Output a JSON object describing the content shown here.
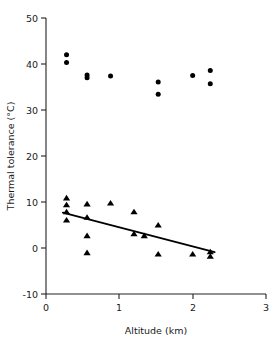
{
  "chart_data": {
    "type": "scatter",
    "title": "",
    "xlabel": "Altitude (km)",
    "ylabel": "Thermal tolerance (°C)",
    "xlim": [
      0,
      3
    ],
    "ylim": [
      -10,
      50
    ],
    "xticks": [
      0,
      1,
      2,
      3
    ],
    "xtick_labels": [
      "0",
      "1",
      "2",
      "3"
    ],
    "yticks": [
      -10,
      0,
      10,
      20,
      30,
      40,
      50
    ],
    "ytick_labels": [
      "-10",
      "0",
      "10",
      "20",
      "30",
      "40",
      "50"
    ],
    "grid": false,
    "legend": "none",
    "series": [
      {
        "name": "Upper thermal tolerance",
        "marker": "circle",
        "color": "#000000",
        "points": [
          {
            "x": 0.28,
            "y": 42.0
          },
          {
            "x": 0.28,
            "y": 40.3
          },
          {
            "x": 0.56,
            "y": 37.6
          },
          {
            "x": 0.56,
            "y": 37.0
          },
          {
            "x": 0.88,
            "y": 37.4
          },
          {
            "x": 1.53,
            "y": 36.1
          },
          {
            "x": 1.53,
            "y": 33.4
          },
          {
            "x": 2.0,
            "y": 37.5
          },
          {
            "x": 2.24,
            "y": 38.6
          },
          {
            "x": 2.24,
            "y": 35.7
          }
        ]
      },
      {
        "name": "Lower thermal tolerance",
        "marker": "triangle",
        "color": "#000000",
        "points": [
          {
            "x": 0.28,
            "y": 10.8
          },
          {
            "x": 0.28,
            "y": 9.3
          },
          {
            "x": 0.28,
            "y": 7.8
          },
          {
            "x": 0.28,
            "y": 6.0
          },
          {
            "x": 0.56,
            "y": 9.5
          },
          {
            "x": 0.56,
            "y": 6.6
          },
          {
            "x": 0.56,
            "y": 2.6
          },
          {
            "x": 0.56,
            "y": -1.1
          },
          {
            "x": 0.88,
            "y": 9.7
          },
          {
            "x": 1.2,
            "y": 7.8
          },
          {
            "x": 1.2,
            "y": 3.0
          },
          {
            "x": 1.34,
            "y": 2.6
          },
          {
            "x": 1.53,
            "y": 4.9
          },
          {
            "x": 1.53,
            "y": -1.4
          },
          {
            "x": 2.0,
            "y": -1.4
          },
          {
            "x": 2.24,
            "y": -0.9
          },
          {
            "x": 2.24,
            "y": -1.9
          }
        ]
      }
    ],
    "fit_line": {
      "name": "regression-line",
      "x_start": 0.23,
      "y_start": 7.7,
      "x_end": 2.3,
      "y_end": -0.9,
      "color": "#000000"
    }
  }
}
